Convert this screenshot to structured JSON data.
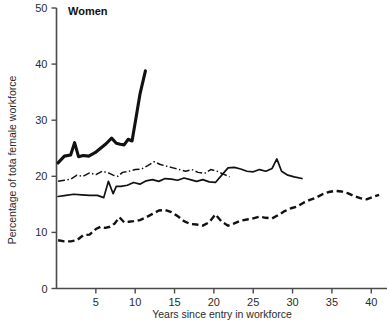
{
  "chart_data": {
    "type": "line",
    "title": "Women",
    "xlabel": "Years since entry in workforce",
    "ylabel": "Percentage of tota  female workforce",
    "xlim": [
      0,
      42
    ],
    "ylim": [
      0,
      50
    ],
    "grid": false,
    "legend": "none",
    "xticks": [
      5,
      10,
      15,
      20,
      25,
      30,
      35,
      40
    ],
    "yticks": [
      0,
      10,
      20,
      30,
      40,
      50
    ],
    "series": [
      {
        "name": "thick-solid",
        "style": "solid-thick",
        "x": [
          0.2,
          1.0,
          1.8,
          2.3,
          2.8,
          3.4,
          4.1,
          4.9,
          5.6,
          6.3,
          7.0,
          7.6,
          8.1,
          8.6,
          9.1,
          9.6,
          10.1,
          10.6,
          11.3
        ],
        "y": [
          22.4,
          23.6,
          23.8,
          26.0,
          23.5,
          23.7,
          23.6,
          24.2,
          25.0,
          25.8,
          26.8,
          25.9,
          25.7,
          25.6,
          26.6,
          26.3,
          30.4,
          34.6,
          38.8
        ]
      },
      {
        "name": "dash-dot",
        "style": "dash-dot",
        "x": [
          0.2,
          1.0,
          1.8,
          2.6,
          3.4,
          4.2,
          5.0,
          5.8,
          6.6,
          7.2,
          7.8,
          8.4,
          9.2,
          10.0,
          10.8,
          11.6,
          12.4,
          13.2,
          14.0,
          14.8,
          15.6,
          16.4,
          17.2,
          18.0,
          18.8,
          19.6,
          20.4,
          21.2,
          22.0
        ],
        "y": [
          19.1,
          19.3,
          19.5,
          20.2,
          20.0,
          20.6,
          20.3,
          20.9,
          20.6,
          20.2,
          20.0,
          20.7,
          20.9,
          21.2,
          21.3,
          21.9,
          22.6,
          22.1,
          21.8,
          21.5,
          21.2,
          20.9,
          21.2,
          20.7,
          20.5,
          21.2,
          20.9,
          20.4,
          19.9
        ]
      },
      {
        "name": "thin-solid",
        "style": "solid-thin",
        "x": [
          0.2,
          1.2,
          2.2,
          3.2,
          4.2,
          5.2,
          6.0,
          6.6,
          7.2,
          7.6,
          8.2,
          9.0,
          9.8,
          10.6,
          11.4,
          12.2,
          13.0,
          13.8,
          14.6,
          15.4,
          16.2,
          17.0,
          17.8,
          18.6,
          19.4,
          20.2,
          21.0,
          21.8,
          22.6,
          23.4,
          24.2,
          25.0,
          25.8,
          26.6,
          27.4,
          28.0,
          28.6,
          29.4,
          30.2,
          31.2
        ],
        "y": [
          16.4,
          16.6,
          16.8,
          16.7,
          16.6,
          16.6,
          16.2,
          19.1,
          16.9,
          18.2,
          18.2,
          18.4,
          18.9,
          18.6,
          19.2,
          19.4,
          19.1,
          19.6,
          19.5,
          19.3,
          19.7,
          19.4,
          19.1,
          19.4,
          19.0,
          18.9,
          20.2,
          21.5,
          21.6,
          21.3,
          20.9,
          20.8,
          21.2,
          20.9,
          21.4,
          23.1,
          20.9,
          20.2,
          19.9,
          19.6
        ]
      },
      {
        "name": "dashed",
        "style": "dashed",
        "x": [
          0.2,
          1.0,
          1.8,
          2.6,
          3.4,
          4.2,
          5.0,
          5.6,
          6.2,
          6.8,
          7.4,
          8.0,
          8.6,
          9.2,
          9.8,
          10.6,
          11.4,
          12.2,
          13.0,
          13.8,
          14.6,
          15.4,
          16.2,
          17.0,
          17.8,
          18.6,
          19.4,
          20.2,
          21.0,
          21.8,
          22.6,
          23.4,
          24.2,
          25.0,
          25.8,
          26.6,
          27.4,
          28.2,
          29.0,
          29.8,
          30.6,
          31.4,
          32.2,
          33.0,
          33.8,
          34.6,
          35.4,
          36.2,
          37.0,
          37.8,
          38.6,
          39.4,
          40.2,
          41.0
        ],
        "y": [
          8.6,
          8.4,
          8.4,
          8.6,
          9.5,
          9.6,
          10.6,
          11.0,
          10.8,
          11.0,
          11.6,
          12.7,
          11.8,
          11.9,
          12.0,
          12.2,
          12.7,
          13.3,
          13.9,
          14.0,
          13.6,
          12.9,
          12.0,
          11.5,
          11.4,
          11.2,
          11.8,
          13.2,
          11.9,
          11.2,
          11.6,
          12.1,
          12.3,
          12.5,
          12.8,
          12.6,
          12.5,
          13.1,
          13.8,
          14.3,
          14.6,
          15.3,
          15.8,
          16.2,
          16.8,
          17.2,
          17.4,
          17.3,
          17.0,
          16.5,
          16.1,
          15.9,
          16.3,
          16.7
        ]
      }
    ]
  }
}
